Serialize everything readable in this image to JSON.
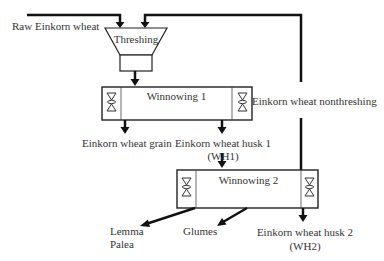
{
  "diagram": {
    "type": "process-flow",
    "inputs": {
      "raw": "Raw Einkorn wheat"
    },
    "processes": {
      "threshing": "Threshing",
      "winnowing1": "Winnowing 1",
      "winnowing2": "Winnowing 2"
    },
    "outputs": {
      "grain": "Einkorn wheat grain",
      "husk1_line1": "Einkorn wheat husk 1",
      "husk1_line2": "(WH1)",
      "nonthreshing": "Einkorn wheat nonthreshing",
      "lemma": "Lemma",
      "palea": "Palea",
      "glumes": "Glumes",
      "husk2_line1": "Einkorn wheat husk 2",
      "husk2_line2": "(WH2)"
    },
    "colors": {
      "line": "#111111",
      "box_border": "#222222",
      "text": "#333333",
      "background": "#ffffff"
    }
  }
}
